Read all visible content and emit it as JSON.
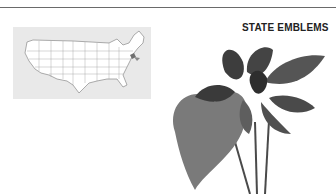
{
  "page": {
    "heading": "STATE EMBLEMS",
    "map": {
      "subject": "United States map with state outlines",
      "highlighted_region": "New England coastal state",
      "highlight_color": "#6f6f6f",
      "background_color": "#e9e9e9"
    },
    "illustration": {
      "subject": "violet plant (state flower)",
      "style": "grayscale photograph"
    },
    "colors": {
      "rule": "#6a6a6a",
      "text": "#222222",
      "leaf_dark": "#3a3a3a",
      "leaf_mid": "#6e6e6e"
    }
  }
}
